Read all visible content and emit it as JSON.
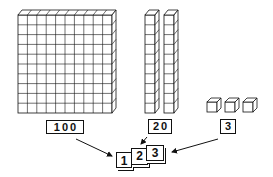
{
  "diagram": {
    "blocks": [
      {
        "type": "hundred-flat",
        "count": 1,
        "grid": "10x10"
      },
      {
        "type": "ten-rod",
        "count": 2,
        "units_per_rod": 10
      },
      {
        "type": "unit-cube",
        "count": 3
      }
    ],
    "labels": {
      "hundreds": "100",
      "tens": "20",
      "ones": "3"
    },
    "cards": {
      "hundreds_digit": "1",
      "tens_digit": "2",
      "ones_digit": "3"
    },
    "result_number": "123"
  }
}
